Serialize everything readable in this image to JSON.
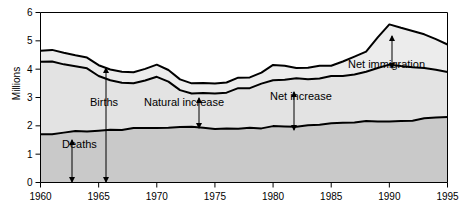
{
  "chart_data": {
    "type": "area",
    "title": "",
    "subtitle": "",
    "xlabel": "",
    "ylabel": "Millions",
    "xlim": [
      1960,
      1995
    ],
    "ylim": [
      0,
      6
    ],
    "ytick_labels": [
      "0",
      "1",
      "2",
      "3",
      "4",
      "5",
      "6"
    ],
    "yticks": [
      0,
      1,
      2,
      3,
      4,
      5,
      6
    ],
    "xtick_labels": [
      "1960",
      "1965",
      "1970",
      "1975",
      "1980",
      "1985",
      "1990",
      "1995"
    ],
    "xticks": [
      1960,
      1965,
      1970,
      1975,
      1980,
      1985,
      1990,
      1995
    ],
    "grid": false,
    "legend_position": "none",
    "x": [
      1960,
      1961,
      1962,
      1963,
      1964,
      1965,
      1966,
      1967,
      1968,
      1969,
      1970,
      1971,
      1972,
      1973,
      1974,
      1975,
      1976,
      1977,
      1978,
      1979,
      1980,
      1981,
      1982,
      1983,
      1984,
      1985,
      1986,
      1987,
      1988,
      1989,
      1990,
      1991,
      1992,
      1993,
      1994,
      1995
    ],
    "series": [
      {
        "name": "Deaths",
        "fill": "#c9c9c9",
        "values": [
          1.7,
          1.7,
          1.76,
          1.82,
          1.8,
          1.83,
          1.86,
          1.85,
          1.92,
          1.92,
          1.92,
          1.93,
          1.96,
          1.97,
          1.93,
          1.89,
          1.91,
          1.9,
          1.93,
          1.91,
          1.99,
          1.98,
          1.97,
          2.02,
          2.04,
          2.09,
          2.11,
          2.12,
          2.17,
          2.15,
          2.15,
          2.17,
          2.18,
          2.27,
          2.29,
          2.31
        ]
      },
      {
        "name": "Births",
        "fill": "#e3e3e3",
        "values": [
          4.26,
          4.27,
          4.17,
          4.1,
          4.03,
          3.76,
          3.61,
          3.52,
          3.5,
          3.6,
          3.73,
          3.56,
          3.26,
          3.14,
          3.16,
          3.14,
          3.17,
          3.33,
          3.33,
          3.49,
          3.61,
          3.63,
          3.68,
          3.64,
          3.67,
          3.76,
          3.76,
          3.81,
          3.91,
          4.04,
          4.16,
          4.11,
          4.07,
          4.04,
          3.98,
          3.9
        ]
      },
      {
        "name": "Net immigration",
        "fill": "#ececec",
        "values": [
          4.65,
          4.68,
          4.58,
          4.49,
          4.41,
          4.14,
          3.99,
          3.91,
          3.89,
          4.01,
          4.16,
          3.97,
          3.64,
          3.5,
          3.51,
          3.49,
          3.53,
          3.7,
          3.71,
          3.88,
          4.15,
          4.12,
          4.04,
          4.05,
          4.12,
          4.12,
          4.27,
          4.44,
          4.62,
          5.12,
          5.58,
          5.46,
          5.35,
          5.23,
          5.06,
          4.87
        ]
      }
    ],
    "annotations": [
      {
        "label": "Deaths",
        "x": 62,
        "y": 148,
        "arrow_x": 72,
        "arrow_top": 140,
        "arrow_bottom": 182
      },
      {
        "label": "Births",
        "x": 90,
        "y": 106,
        "arrow_x": 106,
        "arrow_top": 68,
        "arrow_bottom": 182
      },
      {
        "label": "Natural increase",
        "x": 144,
        "y": 106,
        "arrow_x": 199,
        "arrow_top": 98,
        "arrow_bottom": 128
      },
      {
        "label": "Net increase",
        "x": 270,
        "y": 100,
        "arrow_x": 294,
        "arrow_top": 92,
        "arrow_bottom": 130
      },
      {
        "label": "Net immigration",
        "x": 348,
        "y": 68,
        "arrow_x": 392,
        "arrow_top": 36,
        "arrow_bottom": 68
      }
    ]
  }
}
